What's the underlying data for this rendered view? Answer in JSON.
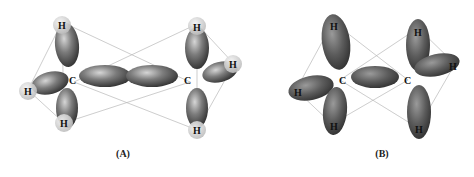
{
  "figure": {
    "panels": [
      {
        "id": "A",
        "caption": "(A)",
        "atoms": {
          "carbon_label": "C",
          "hydrogen_label": "H"
        },
        "description": "sp3 hybrid orbitals with H 1s spheres; C–C sigma overlap"
      },
      {
        "id": "B",
        "caption": "(B)",
        "atoms": {
          "carbon_label": "C",
          "hydrogen_label": "H"
        },
        "description": "Resulting sigma bonding molecular orbitals"
      }
    ]
  },
  "colors": {
    "lobe_dark": "#3a3a3a",
    "lobe_mid": "#7a7a7a",
    "lobe_light": "#c8c8c8",
    "h_sphere": "#d8d8d8",
    "frame_lines": "#b5b5b5",
    "text": "#111111"
  }
}
